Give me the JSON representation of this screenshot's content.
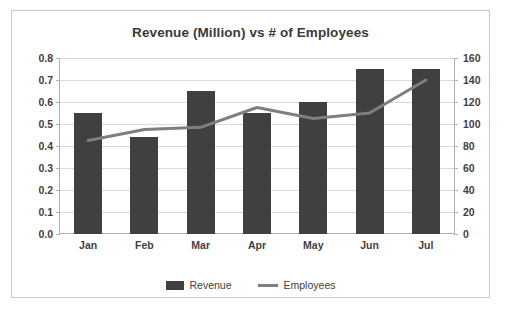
{
  "chart_data": {
    "type": "bar",
    "title": "Revenue (Million) vs # of Employees",
    "xlabel": "",
    "ylabel": "",
    "categories": [
      "Jan",
      "Feb",
      "Mar",
      "Apr",
      "May",
      "Jun",
      "Jul"
    ],
    "series": [
      {
        "name": "Revenue",
        "type": "bar",
        "axis": "left",
        "color": "#404040",
        "values": [
          0.55,
          0.44,
          0.65,
          0.55,
          0.6,
          0.75,
          0.75
        ]
      },
      {
        "name": "Employees",
        "type": "line",
        "axis": "right",
        "color": "#7f7f7f",
        "values": [
          85,
          95,
          97,
          115,
          105,
          110,
          140
        ]
      }
    ],
    "left_axis": {
      "ticks": [
        "0.0",
        "0.1",
        "0.2",
        "0.3",
        "0.4",
        "0.5",
        "0.6",
        "0.7",
        "0.8"
      ],
      "min": 0,
      "max": 0.8
    },
    "right_axis": {
      "ticks": [
        "0",
        "20",
        "40",
        "60",
        "80",
        "100",
        "120",
        "140",
        "160"
      ],
      "min": 0,
      "max": 160
    },
    "grid": true,
    "legend_position": "bottom",
    "legend": [
      "Revenue",
      "Employees"
    ]
  }
}
